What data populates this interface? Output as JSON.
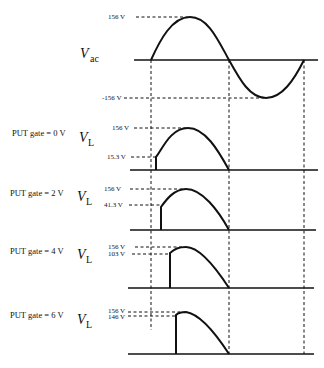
{
  "diagram": {
    "vac": {
      "symbol": "V",
      "subscript": "ac",
      "peak_label": "156 V",
      "trough_label": "-156 V"
    },
    "panels": [
      {
        "gate_label": "PUT gate = 0 V",
        "symbol": "V",
        "subscript": "L",
        "peak_label": "156 V",
        "fire_label": "15.3 V"
      },
      {
        "gate_label": "PUT gate = 2 V",
        "symbol": "V",
        "subscript": "L",
        "peak_label": "156 V",
        "fire_label": "41.3 V"
      },
      {
        "gate_label": "PUT gate = 4 V",
        "symbol": "V",
        "subscript": "L",
        "peak_label": "156 V",
        "fire_label": "103 V"
      },
      {
        "gate_label": "PUT gate = 6 V",
        "symbol": "V",
        "subscript": "L",
        "peak_label": "156 V",
        "fire_label": "146 V"
      }
    ]
  }
}
